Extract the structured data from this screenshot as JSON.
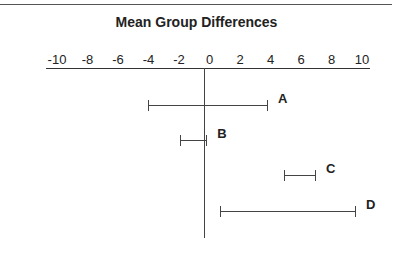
{
  "chart_data": {
    "type": "interval",
    "title": "Mean  Group Differences",
    "xlabel": "",
    "ylabel": "",
    "xlim": [
      -10,
      10
    ],
    "x_ticks": [
      "-10",
      "-8",
      "-6",
      "-4",
      "-2",
      "0",
      "2",
      "4",
      "6",
      "8",
      "10"
    ],
    "axis_position": "top",
    "grid": false,
    "reference_line": 0,
    "series": [
      {
        "name": "A",
        "low": -3.5,
        "high": 4.0
      },
      {
        "name": "B",
        "low": -1.5,
        "high": 0.2
      },
      {
        "name": "C",
        "low": 5.0,
        "high": 7.0
      },
      {
        "name": "D",
        "low": 1.0,
        "high": 9.5
      }
    ]
  }
}
